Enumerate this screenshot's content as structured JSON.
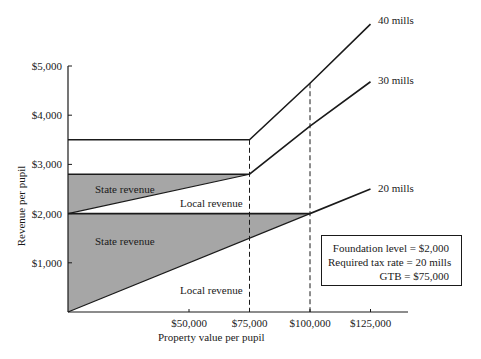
{
  "chart_data": {
    "type": "line",
    "title": "",
    "xlabel": "Property value per pupil",
    "ylabel": "Revenue per pupil",
    "xlim": [
      0,
      140000
    ],
    "ylim": [
      0,
      5000
    ],
    "grid": false,
    "x_ticks": [
      {
        "value": 50000,
        "label": "$50,000"
      },
      {
        "value": 75000,
        "label": "$75,000"
      },
      {
        "value": 100000,
        "label": "$100,000"
      },
      {
        "value": 125000,
        "label": "$125,000"
      }
    ],
    "y_ticks": [
      {
        "value": 1000,
        "label": "$1,000"
      },
      {
        "value": 2000,
        "label": "$2,000"
      },
      {
        "value": 3000,
        "label": "$3,000"
      },
      {
        "value": 4000,
        "label": "$4,000"
      },
      {
        "value": 5000,
        "label": "$5,000"
      }
    ],
    "series": [
      {
        "name": "40 mills",
        "points": [
          [
            0,
            3500
          ],
          [
            75000,
            3500
          ],
          [
            100000,
            4650
          ],
          [
            125000,
            5850
          ]
        ]
      },
      {
        "name": "30 mills",
        "points": [
          [
            0,
            2800
          ],
          [
            75000,
            2800
          ],
          [
            100000,
            3780
          ],
          [
            125000,
            4680
          ]
        ]
      },
      {
        "name": "20 mills",
        "points": [
          [
            0,
            2000
          ],
          [
            100000,
            2000
          ],
          [
            125000,
            2500
          ]
        ]
      }
    ],
    "shaded_regions": [
      {
        "label": "State revenue",
        "polygon": [
          [
            0,
            2000
          ],
          [
            75000,
            2800
          ],
          [
            0,
            2800
          ]
        ],
        "color": "#a6a6a6"
      },
      {
        "label": "State revenue",
        "polygon": [
          [
            0,
            0
          ],
          [
            100000,
            2000
          ],
          [
            0,
            2000
          ]
        ],
        "color": "#a6a6a6"
      }
    ],
    "dividing_lines": [
      {
        "from": [
          0,
          2000
        ],
        "to": [
          75000,
          2800
        ]
      },
      {
        "from": [
          0,
          0
        ],
        "to": [
          100000,
          2000
        ]
      }
    ],
    "vertical_dashed_lines": [
      {
        "x": 75000,
        "from_y": 0,
        "to_y": 3500
      },
      {
        "x": 100000,
        "from_y": 0,
        "to_y": 4650
      }
    ],
    "annotations": [
      {
        "text": "State revenue",
        "x": 10000,
        "y": 2550
      },
      {
        "text": "Local revenue",
        "x": 60000,
        "y": 2250
      },
      {
        "text": "State revenue",
        "x": 10000,
        "y": 1500
      },
      {
        "text": "Local revenue",
        "x": 60000,
        "y": 400
      }
    ],
    "legend": {
      "position": "lower right",
      "lines": [
        "Foundation level = $2,000",
        "Required tax rate = 20 mills",
        "GTB = $75,000"
      ]
    }
  },
  "labels": {
    "region_state_upper": "State revenue",
    "region_local_upper": "Local revenue",
    "region_state_lower": "State revenue",
    "region_local_lower": "Local revenue",
    "series_40": "40 mills",
    "series_30": "30 mills",
    "series_20": "20 mills"
  }
}
